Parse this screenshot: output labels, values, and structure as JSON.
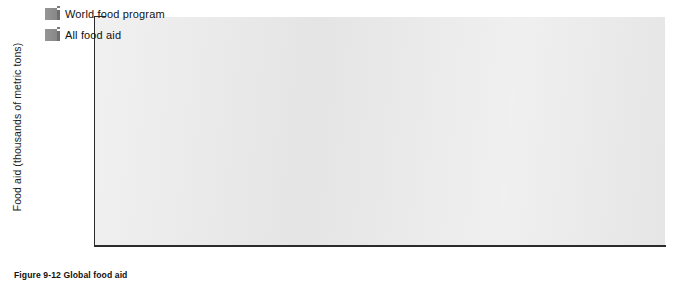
{
  "figure": {
    "caption": "Figure 9-12  Global food aid",
    "background_color": "#ffffff",
    "plot_background_color": "#e9e9e9",
    "bar_color": "#8e8e8e",
    "bar_shadow_color": "#6f6f6f",
    "axis_color": "#2b2b2b"
  },
  "legend": {
    "position": "top-left-inside",
    "items": [
      {
        "label": "World food program",
        "color": "#8e8e8e"
      },
      {
        "label": "All food aid",
        "color": "#8e8e8e"
      }
    ]
  },
  "axes": {
    "ylabel": "Food aid (thousands of metric tons)",
    "xlabel": "",
    "yticks": [
      "0",
      "2,000",
      "4,000",
      "6,000",
      "8,000",
      "10,000",
      "12,000",
      "14,000",
      "16,000",
      "18,000"
    ],
    "ytick_values": [
      0,
      2000,
      4000,
      6000,
      8000,
      10000,
      12000,
      14000,
      16000,
      18000
    ],
    "ymin": 0,
    "ymax": 18000,
    "grid": true
  },
  "chart_data": {
    "type": "bar",
    "title": "Figure 9-12  Global food aid",
    "xlabel": "",
    "ylabel": "Food aid (thousands of metric tons)",
    "ylim": [
      0,
      18000
    ],
    "ytick_step": 2000,
    "grid": true,
    "legend_position": "upper left (inside plot)",
    "categories": [
      "1993",
      "1994",
      "1995",
      "1996",
      "1997",
      "1998",
      "1999",
      "2000",
      "2001",
      "2002",
      "2003",
      "2004"
    ],
    "series": [
      {
        "name": "World food program",
        "color": "#8e8e8e",
        "values": [
          3500,
          3150,
          2400,
          1950,
          2400,
          2450,
          2950,
          3150,
          3650,
          3250,
          4200,
          3000
        ]
      },
      {
        "name": "All food aid",
        "color": "#8e8e8e",
        "values": [
          16700,
          12450,
          9500,
          6650,
          6800,
          8300,
          14350,
          10600,
          10350,
          9050,
          9550,
          6750
        ]
      }
    ]
  }
}
